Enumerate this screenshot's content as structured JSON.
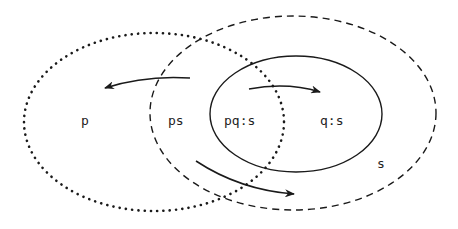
{
  "diagram": {
    "type": "venn-like region diagram",
    "regions": {
      "p": {
        "label": "p",
        "border": "dotted"
      },
      "s": {
        "label": "s",
        "border": "dashed"
      },
      "q": {
        "border": "solid"
      }
    },
    "labels": {
      "p": "p",
      "ps": "ps",
      "pqs": "pq:s",
      "qs": "q:s",
      "s": "s"
    },
    "arrows": [
      {
        "from": "ps",
        "to": "p"
      },
      {
        "from": "pq:s",
        "to": "q:s"
      },
      {
        "from": "ps",
        "to": "s"
      }
    ],
    "colors": {
      "stroke": "#1a1a1a",
      "background": "#ffffff"
    }
  }
}
